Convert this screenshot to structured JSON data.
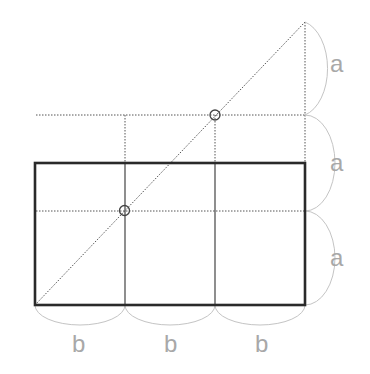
{
  "diagram": {
    "colors": {
      "outline": "#2a2a2a",
      "grid_solid": "#444444",
      "dotted": "#555555",
      "arc": "#c4c4c4",
      "label": "#a8a8a8"
    },
    "labels": {
      "vertical": [
        "a",
        "a",
        "a"
      ],
      "horizontal": [
        "b",
        "b",
        "b"
      ]
    },
    "geometry": {
      "rect": {
        "x": 35,
        "y": 163,
        "width": 270,
        "height": 142
      },
      "column_lines_x": [
        125,
        215
      ],
      "dotted_h_y": [
        115,
        211
      ],
      "apex": {
        "x": 305,
        "y": 22
      },
      "markers": [
        {
          "x": 125,
          "y": 211
        },
        {
          "x": 215,
          "y": 115
        }
      ]
    }
  }
}
